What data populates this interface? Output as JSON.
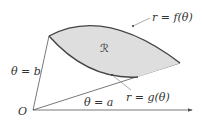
{
  "diagram": {
    "type": "polar-region",
    "colors": {
      "region_fill": "#dedede",
      "curve_stroke": "#444444",
      "ray_stroke": "#555555",
      "leader_stroke": "#888888",
      "text": "#333333"
    },
    "labels": {
      "origin": "O",
      "region": "ℛ",
      "outer_curve": "r = f(θ)",
      "inner_curve": "r = g(θ)",
      "ray_upper": "θ = b",
      "ray_lower": "θ = a"
    }
  }
}
